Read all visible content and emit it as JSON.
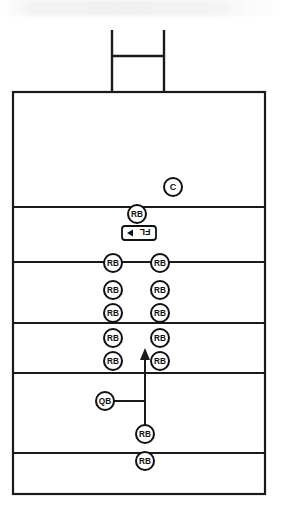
{
  "diagram": {
    "type": "american-football-play-diagram",
    "colors": {
      "line": "#1a1a1a",
      "background": "#ffffff",
      "marker_fill": "#ffffff",
      "marker_stroke": "#111111",
      "text": "#111111"
    },
    "field": {
      "name": "field-box",
      "x": 13,
      "y": 92,
      "width": 252,
      "height": 402,
      "yard_lines": [
        207,
        262,
        323,
        373,
        453
      ]
    },
    "goal_post": {
      "name": "goal-post",
      "left_upright_x": 112,
      "right_upright_x": 164,
      "top_y": 30,
      "base_y": 92,
      "crossbar_y": 56
    },
    "markers": [
      {
        "label": "C",
        "name": "player-center",
        "x": 173,
        "y": 187,
        "r": 9
      },
      {
        "label": "RB",
        "name": "player-rb-line-center",
        "x": 137,
        "y": 214,
        "r": 9
      },
      {
        "label": "RB",
        "name": "player-rb-left-1",
        "x": 113,
        "y": 263,
        "r": 9
      },
      {
        "label": "RB",
        "name": "player-rb-right-1",
        "x": 160,
        "y": 263,
        "r": 9
      },
      {
        "label": "RB",
        "name": "player-rb-left-2",
        "x": 113,
        "y": 290,
        "r": 9
      },
      {
        "label": "RB",
        "name": "player-rb-right-2",
        "x": 160,
        "y": 290,
        "r": 9
      },
      {
        "label": "RB",
        "name": "player-rb-left-3",
        "x": 113,
        "y": 313,
        "r": 9
      },
      {
        "label": "RB",
        "name": "player-rb-right-3",
        "x": 160,
        "y": 313,
        "r": 9
      },
      {
        "label": "RB",
        "name": "player-rb-left-4",
        "x": 113,
        "y": 338,
        "r": 9
      },
      {
        "label": "RB",
        "name": "player-rb-right-4",
        "x": 160,
        "y": 338,
        "r": 9
      },
      {
        "label": "RB",
        "name": "player-rb-left-5",
        "x": 113,
        "y": 361,
        "r": 9
      },
      {
        "label": "RB",
        "name": "player-rb-right-5",
        "x": 160,
        "y": 361,
        "r": 9
      },
      {
        "label": "QB",
        "name": "player-quarterback",
        "x": 105,
        "y": 401,
        "r": 9
      },
      {
        "label": "RB",
        "name": "player-rb-bottom-1",
        "x": 145,
        "y": 434,
        "r": 9
      },
      {
        "label": "RB",
        "name": "player-rb-bottom-2",
        "x": 145,
        "y": 461,
        "r": 9
      }
    ],
    "flanker_box": {
      "name": "flanker-label-box",
      "label": "FL",
      "x": 122,
      "y": 226,
      "width": 34,
      "height": 14,
      "arrow_direction": "left"
    },
    "motion_arrow": {
      "name": "motion-arrow",
      "from_x": 145,
      "from_y": 434,
      "to_x": 145,
      "to_y": 350,
      "direction": "up"
    },
    "qb_connector": {
      "name": "qb-connector-line",
      "from_x": 114,
      "from_y": 401,
      "to_x": 145,
      "to_y": 401
    }
  }
}
